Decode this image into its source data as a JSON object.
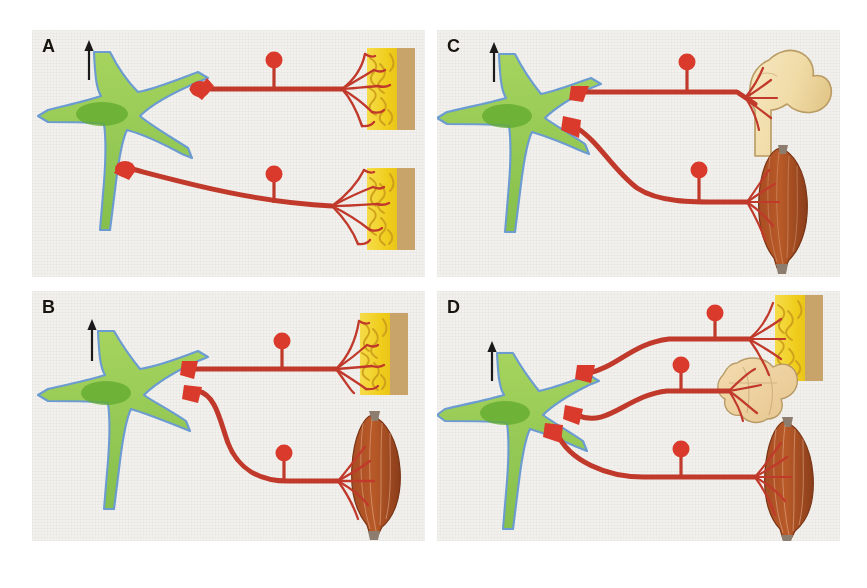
{
  "figure": {
    "background_color": "#ffffff",
    "panel_background_color": "#f2f1ed",
    "width": 867,
    "height": 588
  },
  "palette": {
    "neuron_fill": "#8cc152",
    "neuron_fill_light": "#a6d45e",
    "neuron_outline": "#6b9bd1",
    "nucleus": "#5fa62f",
    "axon_red": "#c0392b",
    "axon_red_light": "#d94f3d",
    "ganglion_red": "#d93a2b",
    "skin_yellow": "#f3d32e",
    "skin_tan": "#c9a46a",
    "nerve_ending_ochre": "#cfa11c",
    "muscle_brown": "#9b4a22",
    "muscle_brown_light": "#c8642f",
    "tendon_grey": "#8d7d6e",
    "bone_cream": "#f2dfae",
    "bone_outline": "#b99b63",
    "organ_tan": "#edd09a",
    "arrow_black": "#1a1a1a",
    "label_black": "#18150f"
  },
  "panels": [
    {
      "id": "A",
      "label": "A",
      "position": "top-left",
      "description": "One sensory neuron sends two separate axons, each ending in a skin (epidermis) target",
      "arrow": {
        "name": "direction-arrow",
        "direction": "up"
      },
      "soma": {
        "name": "neuron-cell-body",
        "nucleus": true
      },
      "axons": [
        {
          "name": "axon-upper",
          "route": "straight",
          "ganglion": true,
          "target": "skin"
        },
        {
          "name": "axon-lower",
          "route": "curved-down",
          "ganglion": true,
          "target": "skin"
        }
      ],
      "targets": [
        {
          "type": "skin",
          "label": "skin",
          "position": "upper-right"
        },
        {
          "type": "skin",
          "label": "skin",
          "position": "lower-right"
        }
      ]
    },
    {
      "id": "B",
      "label": "B",
      "position": "bottom-left",
      "description": "One sensory neuron sends two axons: one to skin, one to skeletal muscle",
      "arrow": {
        "name": "direction-arrow",
        "direction": "up"
      },
      "soma": {
        "name": "neuron-cell-body",
        "nucleus": true
      },
      "axons": [
        {
          "name": "axon-upper",
          "route": "straight",
          "ganglion": true,
          "target": "skin"
        },
        {
          "name": "axon-lower",
          "route": "curved-down",
          "ganglion": true,
          "target": "muscle"
        }
      ],
      "targets": [
        {
          "type": "skin",
          "label": "skin",
          "position": "upper-right"
        },
        {
          "type": "muscle",
          "label": "skeletal muscle",
          "position": "lower-right"
        }
      ]
    },
    {
      "id": "C",
      "label": "C",
      "position": "top-right",
      "description": "One sensory neuron sends two axons: one to bone (femur), one to skeletal muscle",
      "arrow": {
        "name": "direction-arrow",
        "direction": "up"
      },
      "soma": {
        "name": "neuron-cell-body",
        "nucleus": true
      },
      "axons": [
        {
          "name": "axon-upper",
          "route": "straight",
          "ganglion": true,
          "target": "bone"
        },
        {
          "name": "axon-lower",
          "route": "curved-down",
          "ganglion": true,
          "target": "muscle"
        }
      ],
      "targets": [
        {
          "type": "bone",
          "label": "bone",
          "position": "upper-right"
        },
        {
          "type": "muscle",
          "label": "skeletal muscle",
          "position": "lower-right"
        }
      ]
    },
    {
      "id": "D",
      "label": "D",
      "position": "bottom-right",
      "description": "One sensory neuron sends three axons: to skin, to viscera/organ, and to skeletal muscle",
      "arrow": {
        "name": "direction-arrow",
        "direction": "up"
      },
      "soma": {
        "name": "neuron-cell-body",
        "nucleus": true
      },
      "axons": [
        {
          "name": "axon-upper",
          "route": "arched-up",
          "ganglion": true,
          "target": "skin"
        },
        {
          "name": "axon-middle",
          "route": "straight",
          "ganglion": true,
          "target": "organ"
        },
        {
          "name": "axon-lower",
          "route": "arched-down",
          "ganglion": true,
          "target": "muscle"
        }
      ],
      "targets": [
        {
          "type": "skin",
          "label": "skin",
          "position": "upper-right"
        },
        {
          "type": "organ",
          "label": "viscera",
          "position": "middle-right"
        },
        {
          "type": "muscle",
          "label": "skeletal muscle",
          "position": "lower-right"
        }
      ]
    }
  ]
}
